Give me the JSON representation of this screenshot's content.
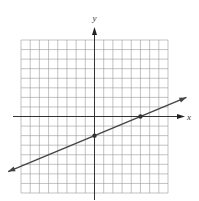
{
  "chart_data": {
    "type": "line",
    "title": "",
    "xlabel": "x",
    "ylabel": "y",
    "xlim": [
      -8,
      8
    ],
    "ylim": [
      -8,
      8
    ],
    "grid": true,
    "grid_step": 1,
    "tick_labels": false,
    "series": [
      {
        "name": "line",
        "equation": "y = (2/5)x - 2",
        "slope": 0.4,
        "intercept": -2,
        "x": [
          -9.4,
          10.0
        ],
        "y": [
          -5.76,
          2.0
        ],
        "arrows_both_ends": true
      }
    ],
    "points": [
      {
        "name": "y-intercept",
        "x": 0,
        "y": -2
      },
      {
        "name": "x-intercept",
        "x": 5,
        "y": 0
      }
    ],
    "colors": {
      "grid": "#9a9a9a",
      "axis": "#333333",
      "line": "#444444"
    }
  }
}
